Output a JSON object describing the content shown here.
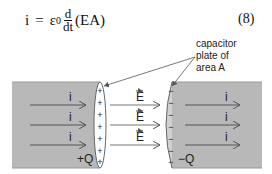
{
  "equation": {
    "lhs": "i",
    "equals": "=",
    "epsilon": "ε",
    "epsilon_sub": "0",
    "frac_num": "d",
    "frac_den": "dt",
    "paren_content": "(EA)",
    "number": "(8)"
  },
  "diagram": {
    "annotation_lines": [
      "capacitor",
      "plate of",
      "area A"
    ],
    "left_current_labels": [
      "i",
      "i",
      "i"
    ],
    "right_current_labels": [
      "i",
      "i",
      "i"
    ],
    "field_labels": [
      "E",
      "E",
      "E"
    ],
    "left_charge": "+Q",
    "right_charge": "−Q",
    "plus_signs": [
      "+",
      "+",
      "+",
      "+",
      "+",
      "+",
      "+"
    ],
    "minus_signs": [
      "−",
      "−",
      "−",
      "−",
      "−",
      "−",
      "−"
    ],
    "colors": {
      "conductor_fill": "#b8b8b8",
      "arrow": "#555555",
      "text": "#222222"
    }
  }
}
